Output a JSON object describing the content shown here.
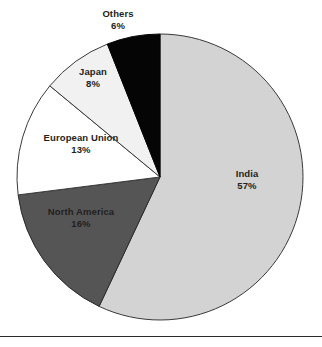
{
  "figure": {
    "background_color": "#ffffff",
    "rule_color": "#2b2b2b"
  },
  "chart_data": {
    "type": "pie",
    "title": "",
    "subtitle": "",
    "xlabel": "",
    "ylabel": "",
    "legend_position": "none",
    "labels_position": "on-slice",
    "start_angle_deg": 0,
    "direction": "clockwise",
    "units": "percent",
    "categories": [
      "India",
      "North America",
      "European Union",
      "Japan",
      "Others"
    ],
    "values": [
      57,
      16,
      13,
      8,
      6
    ],
    "slices": [
      {
        "name": "India",
        "value": 57,
        "value_label": "57%",
        "color": "#d3d3d3",
        "edge_color": "#3a3a3a"
      },
      {
        "name": "North America",
        "value": 16,
        "value_label": "16%",
        "color": "#555555",
        "edge_color": "#2b2b2b"
      },
      {
        "name": "European Union",
        "value": 13,
        "value_label": "13%",
        "color": "#ffffff",
        "edge_color": "#3a3a3a"
      },
      {
        "name": "Japan",
        "value": 8,
        "value_label": "8%",
        "color": "#f1f1f1",
        "edge_color": "#3a3a3a"
      },
      {
        "name": "Others",
        "value": 6,
        "value_label": "6%",
        "color": "#050505",
        "edge_color": "#050505"
      }
    ],
    "labels": [
      {
        "name": "Others",
        "value_label": "6%"
      },
      {
        "name": "Japan",
        "value_label": "8%"
      },
      {
        "name": "European Union",
        "value_label": "13%"
      },
      {
        "name": "North America",
        "value_label": "16%"
      },
      {
        "name": "India",
        "value_label": "57%"
      }
    ]
  }
}
